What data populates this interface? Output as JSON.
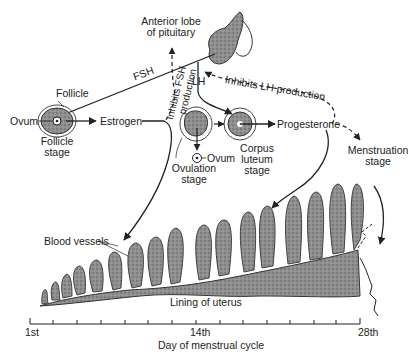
{
  "diagram": {
    "labels": {
      "pituitary": [
        "Anterior lobe",
        "of pituitary"
      ],
      "fsh": "FSH",
      "lh": "LH",
      "inhibits_fsh": [
        "Inhibits FSH",
        "production"
      ],
      "inhibits_lh": "Inhibits LH production",
      "follicle": "Follicle",
      "ovum_left": "Ovum",
      "follicle_stage": [
        "Follicle",
        "stage"
      ],
      "estrogen": "Estrogen",
      "ovum_mid": "Ovum",
      "ovulation_stage": [
        "Ovulation",
        "stage"
      ],
      "corpus_luteum_stage": [
        "Corpus",
        "luteum",
        "stage"
      ],
      "progesterone": "Progesterone",
      "menstruation_stage": [
        "Menstruation",
        "stage"
      ],
      "blood_vessels": "Blood vessels",
      "lining": "Lining of uterus"
    },
    "axis": {
      "label": "Day of menstrual cycle",
      "ticks": [
        "1st",
        "14th",
        "28th"
      ],
      "tick_count": 15
    },
    "colors": {
      "tissue": "#8a8a8a",
      "ink": "#222222",
      "background": "#ffffff"
    }
  }
}
